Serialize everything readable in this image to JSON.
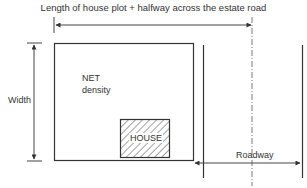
{
  "diagram": {
    "title": "Length of house plot + halfway across the estate road",
    "plot_label_line1": "NET",
    "plot_label_line2": "density",
    "width_label": "Width",
    "house_label": "HOUSE",
    "roadway_label": "Roadway",
    "colors": {
      "line": "#333333",
      "background": "#ffffff"
    }
  }
}
